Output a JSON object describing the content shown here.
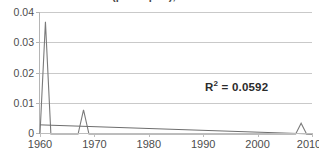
{
  "chart_data": {
    "type": "line",
    "title": "(per capita), 1960–2010",
    "xlabel": "",
    "ylabel": "",
    "xlim": [
      1960,
      2010
    ],
    "ylim": [
      0,
      0.04
    ],
    "grid": true,
    "legend": "none",
    "x_ticks": [
      "1960",
      "1970",
      "1980",
      "1990",
      "2000",
      "2010"
    ],
    "x_tick_values": [
      1960,
      1970,
      1980,
      1990,
      2000,
      2010
    ],
    "y_ticks": [
      "0",
      "0.01",
      "0.02",
      "0.03",
      "0.04"
    ],
    "y_tick_values": [
      0,
      0.01,
      0.02,
      0.03,
      0.04
    ],
    "annotations": [
      {
        "name": "r-squared",
        "label": "R",
        "superscript": "2",
        "equals": "= 0.0592",
        "value": 0.0592
      }
    ],
    "series": [
      {
        "name": "data",
        "color": "#7a7a7a",
        "x": [
          1960,
          1961,
          1962,
          1963,
          1964,
          1965,
          1966,
          1967,
          1968,
          1969,
          1970,
          1971,
          1972,
          1973,
          1974,
          1975,
          1976,
          1977,
          1978,
          1979,
          1980,
          1981,
          1982,
          1983,
          1984,
          1985,
          1986,
          1987,
          1988,
          1989,
          1990,
          1991,
          1992,
          1993,
          1994,
          1995,
          1996,
          1997,
          1998,
          1999,
          2000,
          2001,
          2002,
          2003,
          2004,
          2005,
          2006,
          2007,
          2008,
          2009,
          2010
        ],
        "values": [
          0,
          0.0368,
          0,
          0,
          0,
          0,
          0,
          0,
          0.0079,
          0,
          0,
          0,
          0,
          0,
          0,
          0,
          0,
          0,
          0,
          0,
          0,
          0,
          0,
          0,
          0,
          0,
          0,
          0,
          0,
          0,
          0,
          0,
          0,
          0,
          0,
          0,
          0,
          0,
          0,
          0,
          0,
          0,
          0,
          0,
          0,
          0,
          0,
          0,
          0.0035,
          0,
          0
        ]
      },
      {
        "name": "linear-trend",
        "color": "#6e6e6e",
        "x": [
          1960,
          2010
        ],
        "values": [
          0.003,
          0.0
        ]
      }
    ],
    "peaks": [
      {
        "year": 1961,
        "value": 0.0368
      },
      {
        "year": 1968,
        "value": 0.0079
      },
      {
        "year": 2008,
        "value": 0.0035
      }
    ]
  },
  "colors": {
    "series": "#7a7a7a",
    "trend": "#6e6e6e",
    "grid": "#c9c9c9",
    "axis": "#bdbdbd",
    "tick_text": "#4d4d4d",
    "annotation_text": "#2b2b2b",
    "background": "#ffffff"
  }
}
